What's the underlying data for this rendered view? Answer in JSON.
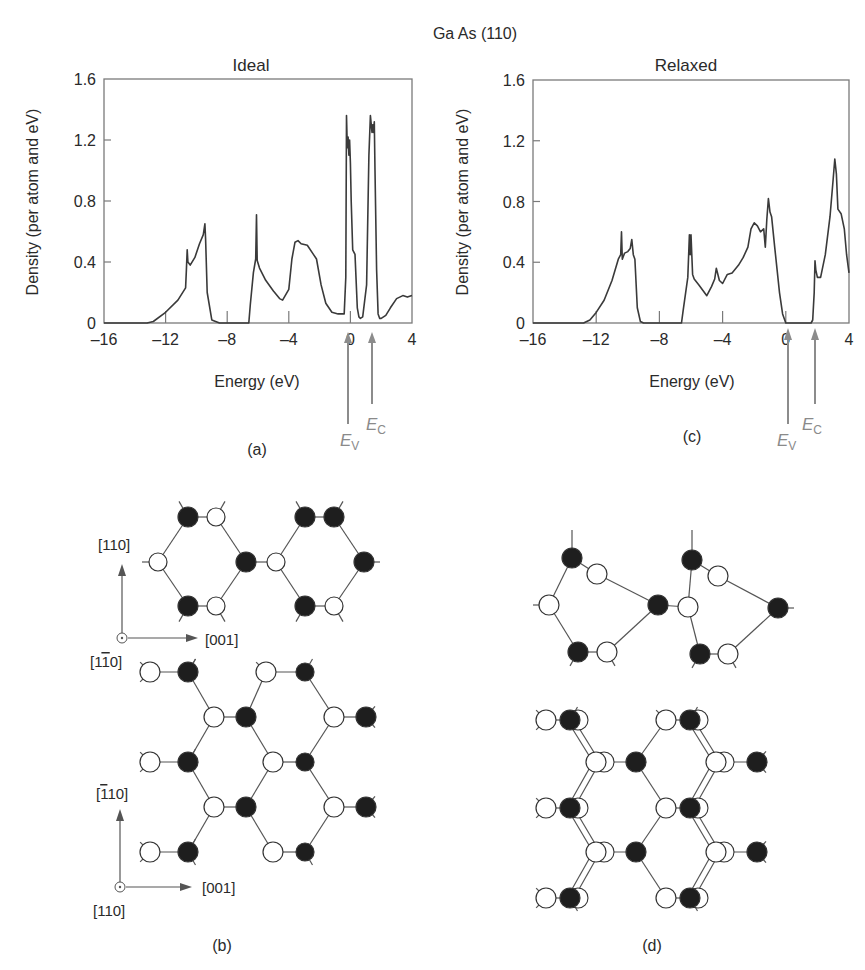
{
  "figure": {
    "title": "Ga As (110)",
    "panel_labels": {
      "a": "(a)",
      "b": "(b)",
      "c": "(c)",
      "d": "(d)"
    }
  },
  "chart_data": [
    {
      "type": "line",
      "panel": "(a)",
      "title": "Ideal",
      "xlabel": "Energy (eV)",
      "ylabel": "Density (per atom and eV)",
      "xlim": [
        -16,
        4
      ],
      "ylim": [
        0,
        1.6
      ],
      "xticks": [
        "-16",
        "-12",
        "-8",
        "-4",
        "0",
        "4"
      ],
      "yticks": [
        "0",
        "0.4",
        "0.8",
        "1.2",
        "1.6"
      ],
      "grid": false,
      "annotations": [
        {
          "label": "E_V",
          "x": -0.1
        },
        {
          "label": "E_C",
          "x": 1.55
        }
      ],
      "series": [
        {
          "name": "DOS ideal",
          "x": [
            -16,
            -13.2,
            -12.8,
            -12,
            -11.2,
            -10.7,
            -10.65,
            -10.6,
            -10.55,
            -10.4,
            -10.1,
            -9.8,
            -9.55,
            -9.45,
            -9.4,
            -9.3,
            -9.0,
            -8.5,
            -6.6,
            -6.5,
            -6.3,
            -6.15,
            -6.1,
            -6.05,
            -5.9,
            -5.5,
            -5.0,
            -4.6,
            -4.4,
            -4.0,
            -3.8,
            -3.6,
            -3.4,
            -3.2,
            -2.8,
            -2.4,
            -2.2,
            -1.9,
            -1.6,
            -1.2,
            -0.8,
            -0.4,
            -0.3,
            -0.25,
            -0.2,
            -0.15,
            -0.1,
            -0.05,
            0,
            0.05,
            0.15,
            0.3,
            0.45,
            0.55,
            0.65,
            0.8,
            1.05,
            1.2,
            1.3,
            1.4,
            1.45,
            1.5,
            1.55,
            1.6,
            1.7,
            1.8,
            1.9,
            2.0,
            2.3,
            2.6,
            3.0,
            3.4,
            3.7,
            4.0
          ],
          "y": [
            0,
            0,
            0.01,
            0.07,
            0.15,
            0.23,
            0.35,
            0.48,
            0.4,
            0.38,
            0.43,
            0.52,
            0.58,
            0.65,
            0.55,
            0.2,
            0.02,
            0,
            0,
            0.12,
            0.33,
            0.42,
            0.71,
            0.41,
            0.36,
            0.28,
            0.21,
            0.16,
            0.15,
            0.22,
            0.42,
            0.53,
            0.54,
            0.52,
            0.51,
            0.45,
            0.42,
            0.25,
            0.13,
            0.07,
            0.06,
            0.06,
            0.3,
            1.36,
            1.15,
            1.22,
            1.1,
            1.2,
            1.05,
            0.8,
            0.48,
            0.45,
            0.1,
            0.04,
            0.03,
            0.04,
            0.25,
            1.1,
            1.36,
            1.25,
            1.3,
            1.25,
            1.32,
            1.0,
            0.35,
            0.06,
            0.03,
            0.03,
            0.05,
            0.1,
            0.16,
            0.18,
            0.17,
            0.18
          ]
        }
      ]
    },
    {
      "type": "line",
      "panel": "(c)",
      "title": "Relaxed",
      "xlabel": "Energy (eV)",
      "ylabel": "Density (per atom and eV)",
      "xlim": [
        -16,
        4
      ],
      "ylim": [
        0,
        1.6
      ],
      "xticks": [
        "-16",
        "-12",
        "-8",
        "-4",
        "0",
        "4"
      ],
      "yticks": [
        "0",
        "0.4",
        "0.8",
        "1.2",
        "1.6"
      ],
      "grid": false,
      "annotations": [
        {
          "label": "E_V",
          "x": 0.0
        },
        {
          "label": "E_C",
          "x": 1.75
        }
      ],
      "series": [
        {
          "name": "DOS relaxed",
          "x": [
            -16,
            -12.8,
            -12.4,
            -12,
            -11.5,
            -11,
            -10.6,
            -10.45,
            -10.4,
            -10.35,
            -10.2,
            -10.0,
            -9.85,
            -9.75,
            -9.65,
            -9.55,
            -9.4,
            -9.2,
            -9.0,
            -6.6,
            -6.5,
            -6.2,
            -6.1,
            -6.05,
            -6.0,
            -5.95,
            -5.9,
            -5.8,
            -5.5,
            -5.0,
            -4.7,
            -4.5,
            -4.4,
            -4.2,
            -4.0,
            -3.7,
            -3.4,
            -3.0,
            -2.7,
            -2.4,
            -2.2,
            -2.0,
            -1.8,
            -1.6,
            -1.4,
            -1.3,
            -1.2,
            -1.1,
            -1.0,
            -0.9,
            -0.7,
            -0.4,
            -0.2,
            0,
            0.5,
            1.6,
            1.7,
            1.8,
            1.85,
            1.9,
            2.0,
            2.2,
            2.5,
            2.8,
            3.0,
            3.1,
            3.2,
            3.3,
            3.5,
            3.7,
            3.85,
            4.0
          ],
          "y": [
            0,
            0,
            0.02,
            0.07,
            0.15,
            0.28,
            0.42,
            0.45,
            0.6,
            0.42,
            0.46,
            0.47,
            0.49,
            0.55,
            0.45,
            0.42,
            0.1,
            0.01,
            0,
            0,
            0.08,
            0.3,
            0.58,
            0.45,
            0.58,
            0.45,
            0.32,
            0.29,
            0.25,
            0.18,
            0.24,
            0.29,
            0.36,
            0.28,
            0.26,
            0.32,
            0.33,
            0.38,
            0.43,
            0.5,
            0.62,
            0.66,
            0.64,
            0.6,
            0.62,
            0.5,
            0.68,
            0.82,
            0.73,
            0.7,
            0.5,
            0.2,
            0.06,
            0,
            0,
            0,
            0.02,
            0.2,
            0.41,
            0.35,
            0.3,
            0.3,
            0.45,
            0.7,
            0.95,
            1.08,
            0.98,
            0.75,
            0.72,
            0.62,
            0.45,
            0.33
          ]
        }
      ]
    }
  ],
  "diagrams": {
    "b": {
      "panel": "(b)",
      "top_axes": {
        "up": "[110]",
        "right": "[001]",
        "out": "[1̅1̅0]"
      },
      "bottom_axes": {
        "up": "[̅1̅110]",
        "right": "[001]",
        "out": "[110]"
      }
    },
    "d": {
      "panel": "(d)"
    }
  },
  "labels": {
    "ev": "E",
    "ev_sub": "V",
    "ec": "E",
    "ec_sub": "C",
    "ax_top_up": "[110]",
    "ax_top_right": "[001]",
    "ax_top_out_a": "[1",
    "ax_top_out_b": "1",
    "ax_top_out_c": "0]",
    "ax_bot_up_a": "[",
    "ax_bot_up_b": "1",
    "ax_bot_up_c": "10]",
    "ax_bot_right": "[001]",
    "ax_bot_out": "[110]"
  },
  "colors": {
    "line": "#3a3a3a",
    "arrow": "#8c8c8c",
    "frame": "#7a7a7a"
  }
}
